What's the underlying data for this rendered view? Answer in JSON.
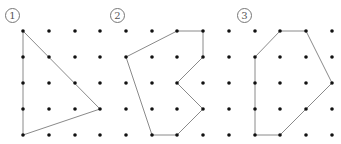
{
  "grid": {
    "columns_x": [
      23,
      49,
      75,
      100,
      126,
      152,
      177,
      203,
      229,
      255,
      280,
      306,
      332
    ],
    "rows_y": [
      31,
      57,
      83,
      109,
      135
    ],
    "dot_radius": 1.8,
    "dot_color": "#111111",
    "line_color": "#8a8a8a"
  },
  "figures": [
    {
      "label": "1",
      "label_pos": [
        5,
        8
      ],
      "polygon_cells": [
        [
          0,
          0
        ],
        [
          3,
          3
        ],
        [
          0,
          4
        ]
      ]
    },
    {
      "label": "2",
      "label_pos": [
        110,
        8
      ],
      "polygon_cells": [
        [
          6,
          0
        ],
        [
          7,
          0
        ],
        [
          7,
          1
        ],
        [
          6,
          2
        ],
        [
          7,
          3
        ],
        [
          6,
          4
        ],
        [
          5,
          4
        ],
        [
          4,
          1
        ]
      ]
    },
    {
      "label": "3",
      "label_pos": [
        237,
        8
      ],
      "polygon_cells": [
        [
          10,
          0
        ],
        [
          11,
          0
        ],
        [
          12,
          2
        ],
        [
          10,
          4
        ],
        [
          9,
          4
        ],
        [
          9,
          1
        ]
      ]
    }
  ]
}
